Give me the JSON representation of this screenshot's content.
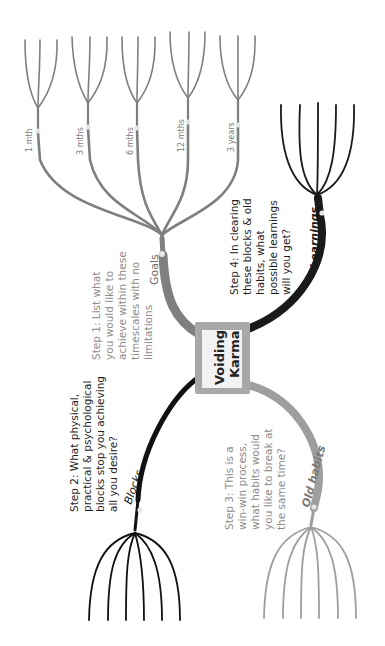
{
  "central": {
    "title_line1": "Voiding",
    "title_line2": "Karma",
    "fill": "#f2f2f2",
    "frame": "#a8a8a8"
  },
  "branches": {
    "goals": {
      "label": "Goals",
      "color": "#808080",
      "sub": [
        "1 mth",
        "3 mths",
        "6 mths",
        "12 mths",
        "3 years"
      ]
    },
    "blocks": {
      "label": "Blocks",
      "color": "#111111"
    },
    "old_habits": {
      "label": "Old habits",
      "color": "#a0a0a0"
    },
    "learnings": {
      "label": "Learnings",
      "color": "#1a1a1a"
    }
  },
  "notes": {
    "step1": [
      "Step 1: List what",
      "you would like to",
      "achieve within these",
      "timescales with no",
      "limitations"
    ],
    "step2": [
      "Step 2: What physical,",
      "practical & psychological",
      "blocks stop you achieving",
      "all you desire?"
    ],
    "step3": [
      "Step 3: This is a",
      "win-win process,",
      "what habits would",
      "you like to break at",
      "the same time?"
    ],
    "step4": [
      "Step 4: In clearing",
      "these blocks & old",
      "habits, what",
      "possible learnings",
      "will you get?"
    ]
  }
}
